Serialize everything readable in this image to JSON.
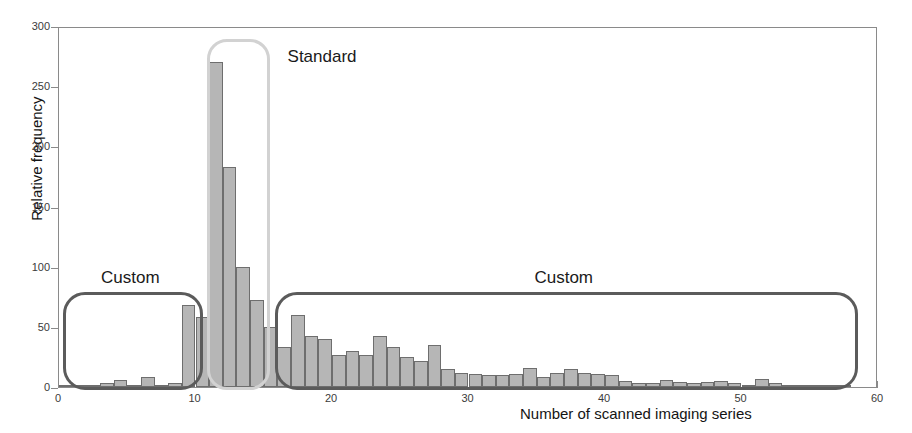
{
  "chart_data": {
    "type": "bar",
    "title": "",
    "subtitle": "",
    "xlabel": "Number of scanned imaging series",
    "ylabel": "Relative frequency",
    "xlim": [
      0,
      60
    ],
    "ylim": [
      0,
      300
    ],
    "xticks": [
      0,
      10,
      20,
      30,
      40,
      50,
      60
    ],
    "yticks": [
      0,
      50,
      100,
      150,
      200,
      250,
      300
    ],
    "grid": false,
    "legend": null,
    "bin_width": 1,
    "bar_color": "#b6b6b6",
    "bar_edge_color": "#6e6e6e",
    "categories": [
      1,
      2,
      3,
      4,
      5,
      6,
      7,
      8,
      9,
      10,
      11,
      12,
      13,
      14,
      15,
      16,
      17,
      18,
      19,
      20,
      21,
      22,
      23,
      24,
      25,
      26,
      27,
      28,
      29,
      30,
      31,
      32,
      33,
      34,
      35,
      36,
      37,
      38,
      39,
      40,
      41,
      42,
      43,
      44,
      45,
      46,
      47,
      48,
      49,
      50,
      51,
      52,
      53,
      54,
      55,
      56,
      57,
      58,
      59,
      60
    ],
    "values": [
      1,
      2,
      1,
      3,
      6,
      2,
      8,
      2,
      3,
      68,
      58,
      270,
      183,
      100,
      72,
      50,
      33,
      60,
      42,
      40,
      27,
      30,
      27,
      42,
      33,
      25,
      22,
      35,
      15,
      12,
      11,
      10,
      10,
      11,
      16,
      8,
      12,
      15,
      12,
      11,
      10,
      5,
      3,
      3,
      6,
      4,
      3,
      4,
      5,
      3,
      2,
      7,
      3,
      2,
      1,
      1,
      1,
      1,
      0,
      0
    ],
    "annotations": [
      {
        "label": "Custom",
        "group": "custom-left",
        "x_range": [
          0.4,
          10.6
        ],
        "y_range": [
          0,
          80
        ]
      },
      {
        "label": "Standard",
        "group": "standard",
        "x_range": [
          10.9,
          15.5
        ],
        "y_range": [
          0,
          290
        ]
      },
      {
        "label": "Custom",
        "group": "custom-right",
        "x_range": [
          15.9,
          58.6
        ],
        "y_range": [
          0,
          80
        ]
      }
    ],
    "annotation_colors": {
      "custom": "#5b5b5b",
      "standard": "#d2d2d2"
    }
  },
  "figure": {
    "ylabel": "Relative frequency",
    "xlabel": "Number of scanned imaging series",
    "ytick_labels": [
      "0",
      "50",
      "100",
      "150",
      "200",
      "250",
      "300"
    ],
    "xtick_labels": [
      "0",
      "10",
      "20",
      "30",
      "40",
      "50",
      "60"
    ],
    "annotation_custom_left": "Custom",
    "annotation_standard": "Standard",
    "annotation_custom_right": "Custom"
  }
}
